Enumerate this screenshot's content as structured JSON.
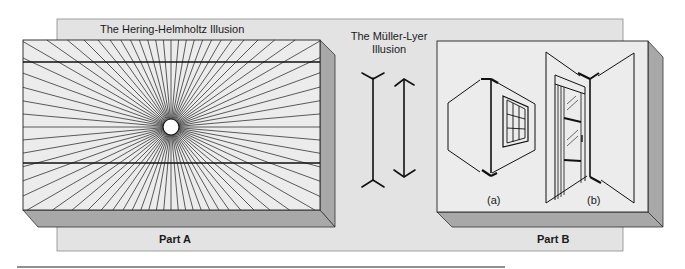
{
  "figure": {
    "titles": {
      "hering": "The Hering-Helmholtz Illusion",
      "muller_line1": "The Müller-Lyer",
      "muller_line2": "Illusion"
    },
    "parts": {
      "a": "Part A",
      "b": "Part B"
    },
    "sublabels": {
      "a": "(a)",
      "b": "(b)"
    },
    "colors": {
      "backdrop": "#e3e3e3",
      "face": "#ececec",
      "side": "#a8a8a8",
      "line": "#1a1a1a"
    }
  }
}
